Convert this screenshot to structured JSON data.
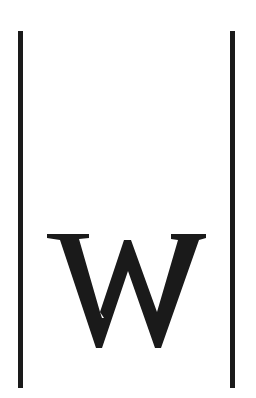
{
  "logo": {
    "letter": "W",
    "description": "Serif letter W between two vertical bars",
    "colors": {
      "foreground": "#1a1a1a",
      "background": "#ffffff"
    }
  }
}
